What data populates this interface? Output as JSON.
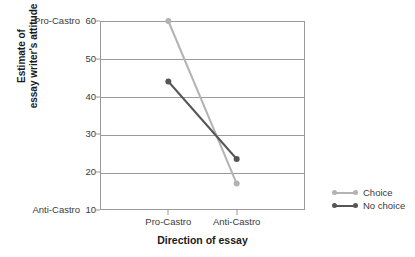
{
  "chart_data": {
    "type": "line",
    "title": "",
    "xlabel": "Direction of essay",
    "ylabel": "Estimate of essay writer's attitude",
    "ylabel_line1": "Estimate of",
    "ylabel_line2": "essay writer's attitude",
    "categories": [
      "Pro-Castro",
      "Anti-Castro"
    ],
    "ylim": [
      10,
      60
    ],
    "yticks": [
      60,
      50,
      40,
      30,
      20,
      10
    ],
    "ytick_labels": [
      "60",
      "50",
      "40",
      "30",
      "20",
      "10"
    ],
    "y_anchor_top": "Pro-Castro",
    "y_anchor_bottom": "Anti-Castro",
    "grid": true,
    "legend_position": "right",
    "series": [
      {
        "name": "Choice",
        "values": [
          60,
          17
        ],
        "color": "#b3b3b3"
      },
      {
        "name": "No choice",
        "values": [
          44,
          23.5
        ],
        "color": "#555555"
      }
    ]
  },
  "legend": {
    "items": [
      {
        "label": "Choice",
        "color": "#b3b3b3"
      },
      {
        "label": "No choice",
        "color": "#555555"
      }
    ]
  },
  "colors": {
    "axis": "#9a9a9a",
    "text": "#3a3a3a",
    "title_text": "#1a1a1a",
    "background": "#ffffff",
    "choice": "#b3b3b3",
    "no_choice": "#555555"
  }
}
